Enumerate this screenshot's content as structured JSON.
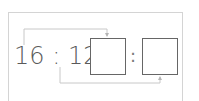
{
  "problem": {
    "left_term": "16",
    "separator": ":",
    "right_term": "12",
    "equals": "=",
    "answer_boxes": [
      {
        "value": ""
      },
      {
        "value": ""
      }
    ],
    "answer_separator": ":"
  },
  "colors": {
    "text": "#5a5a5a",
    "box_border": "#666666",
    "frame_border": "#d4d4d4",
    "bracket_line": "#c8c8c8"
  },
  "brackets": [
    {
      "from": "16",
      "to": "box-1",
      "position": "top"
    },
    {
      "from": "12",
      "to": "box-2",
      "position": "bottom"
    }
  ]
}
